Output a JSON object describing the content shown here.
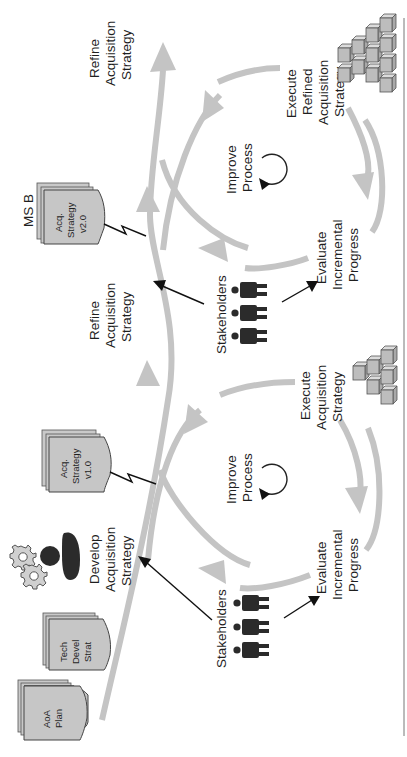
{
  "diagram": {
    "orientation": "rotated-90-ccw",
    "colors": {
      "flow_arrow": "#c4c4c4",
      "documents": "#c6c6c6",
      "stakeholders": "#2b2b2b",
      "text": "#1f1f1f",
      "border": "#666666"
    },
    "documents": [
      {
        "id": "aoa-plan",
        "lines": [
          "AoA",
          "Plan"
        ]
      },
      {
        "id": "tech-devel-strat",
        "lines": [
          "Tech",
          "Devel",
          "Strat"
        ]
      },
      {
        "id": "acq-strategy-v1",
        "lines": [
          "Acq.",
          "Strategy",
          "v1.0"
        ]
      },
      {
        "id": "acq-strategy-v2",
        "lines": [
          "Acq.",
          "Strategy",
          "v2.0"
        ]
      }
    ],
    "milestone": "MS B",
    "develop": {
      "lines": [
        "Develop",
        "Acquisition",
        "Strategy"
      ]
    },
    "cycle1": {
      "execute": [
        "Execute",
        "Acquisition",
        "Strategy"
      ],
      "evaluate": [
        "Evaluate",
        "Incremental",
        "Progress"
      ],
      "improve": [
        "Improve",
        "Process"
      ],
      "stakeholders": "Stakeholders",
      "refine": [
        "Refine",
        "Acquisition",
        "Strategy"
      ]
    },
    "cycle2": {
      "execute": [
        "Execute",
        "Refined",
        "Acquisition",
        "Strategy"
      ],
      "evaluate": [
        "Evaluate",
        "Incremental",
        "Progress"
      ],
      "improve": [
        "Improve",
        "Process"
      ],
      "stakeholders": "Stakeholders",
      "refine": [
        "Refine",
        "Acquisition",
        "Strategy"
      ]
    }
  }
}
